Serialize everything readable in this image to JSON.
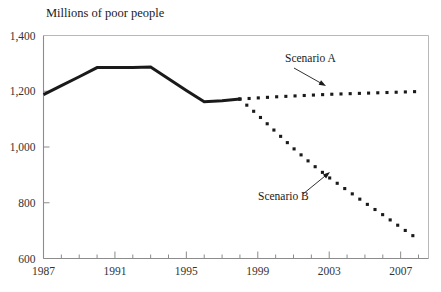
{
  "chart_data": {
    "type": "line",
    "title": "Millions of poor people",
    "xlabel": "",
    "ylabel": "",
    "xlim": [
      1987,
      2008
    ],
    "ylim": [
      600,
      1400
    ],
    "grid": false,
    "legend_position": "inline-annotations",
    "yticks": [
      600,
      800,
      1000,
      1200,
      1400
    ],
    "ytick_labels": [
      "600",
      "800",
      "1,000",
      "1,200",
      "1,400"
    ],
    "xticks": [
      1987,
      1991,
      1995,
      1999,
      2003,
      2007
    ],
    "xtick_labels": [
      "1987",
      "1991",
      "1995",
      "1999",
      "2003",
      "2007"
    ],
    "xminor_ticks": [
      1988,
      1989,
      1990,
      1992,
      1993,
      1994,
      1996,
      1997,
      1998,
      2000,
      2001,
      2002,
      2004,
      2005,
      2006,
      2008
    ],
    "series": [
      {
        "name": "Historical",
        "style": "solid",
        "color": "#1a1a1a",
        "x": [
          1987,
          1988,
          1989,
          1990,
          1991,
          1992,
          1993,
          1994,
          1995,
          1996,
          1997,
          1998
        ],
        "values": [
          1188,
          1220,
          1252,
          1285,
          1285,
          1285,
          1287,
          1245,
          1203,
          1162,
          1166,
          1172
        ]
      },
      {
        "name": "Scenario A",
        "style": "dotted",
        "color": "#1a1a1a",
        "x": [
          1998,
          1999,
          2000,
          2001,
          2002,
          2003,
          2004,
          2005,
          2006,
          2007,
          2008
        ],
        "values": [
          1172,
          1176,
          1180,
          1183,
          1186,
          1189,
          1191,
          1193,
          1195,
          1197,
          1199
        ]
      },
      {
        "name": "Scenario B",
        "style": "dotted",
        "color": "#1a1a1a",
        "x": [
          1998,
          1999,
          2000,
          2001,
          2002,
          2003,
          2004,
          2005,
          2006,
          2007,
          2008
        ],
        "values": [
          1172,
          1115,
          1055,
          995,
          940,
          890,
          845,
          800,
          757,
          712,
          668
        ]
      }
    ],
    "annotations": [
      {
        "label": "Scenario A",
        "text_x": 285,
        "text_y": 62,
        "arrow_from_x": 294,
        "arrow_from_y": 68,
        "arrow_to_x": 326,
        "arrow_to_y": 86
      },
      {
        "label": "Scenario B",
        "text_x": 258,
        "text_y": 200,
        "arrow_from_x": 303,
        "arrow_from_y": 194,
        "arrow_to_x": 330,
        "arrow_to_y": 172
      }
    ],
    "colors": {
      "line": "#1a1a1a",
      "axis": "#8c8c8c",
      "frame": "#b8b8b8",
      "text": "#1a1a1a",
      "background": "#ffffff"
    }
  }
}
